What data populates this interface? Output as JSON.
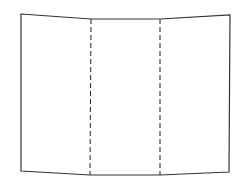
{
  "diagram": {
    "stroke_color": "#333333",
    "background": "#ffffff",
    "outline": {
      "top_left": [
        21,
        14
      ],
      "top_fold_1": [
        91,
        19
      ],
      "top_fold_2": [
        160,
        19
      ],
      "top_right": [
        230,
        15
      ],
      "bottom_right": [
        229,
        172
      ],
      "bottom_fold_2": [
        160,
        175
      ],
      "bottom_fold_1": [
        90,
        175
      ],
      "bottom_left": [
        21,
        171
      ]
    },
    "fold_lines": [
      {
        "x1": 91,
        "y1": 19,
        "x2": 90,
        "y2": 175,
        "style": "dashed"
      },
      {
        "x1": 160,
        "y1": 19,
        "x2": 160,
        "y2": 175,
        "style": "dashed"
      }
    ],
    "panels": [
      "left-panel",
      "center-panel",
      "right-panel"
    ]
  }
}
